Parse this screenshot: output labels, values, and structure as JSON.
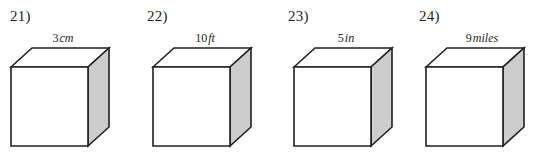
{
  "page": {
    "background_color": "#ffffff",
    "text_color": "#231f20"
  },
  "figure_style": {
    "front_face_color": "#ffffff",
    "top_face_color": "#ffffff",
    "side_face_color": "#cccccc",
    "edge_color": "#231f20"
  },
  "problems": [
    {
      "number_label": "21)",
      "shape": "cube",
      "edge_value": "3",
      "edge_unit": "cm",
      "edge_label_full": "3 cm"
    },
    {
      "number_label": "22)",
      "shape": "cube",
      "edge_value": "10",
      "edge_unit": "ft",
      "edge_label_full": "10 ft"
    },
    {
      "number_label": "23)",
      "shape": "cube",
      "edge_value": "5",
      "edge_unit": "in",
      "edge_label_full": "5 in"
    },
    {
      "number_label": "24)",
      "shape": "cube",
      "edge_value": "9",
      "edge_unit": "miles",
      "edge_label_full": "9 miles"
    }
  ]
}
